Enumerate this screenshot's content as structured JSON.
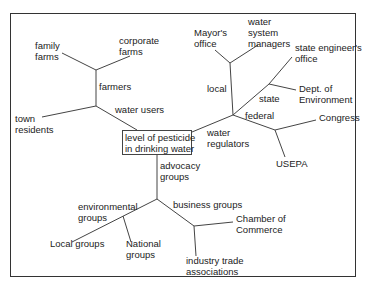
{
  "diagram": {
    "type": "tree",
    "root": "level of pesticide\nin drinking water",
    "labels": {
      "family_farms": "family\nfarms",
      "corporate_farms": "corporate\nfarms",
      "farmers": "farmers",
      "water_users": "water users",
      "town_residents": "town\nresidents",
      "mayors_office": "Mayor's\noffice",
      "water_system_managers": "water\nsystem\nmanagers",
      "local": "local",
      "state_engineers_office": "state engineer's\noffice",
      "state": "state",
      "dept_environment": "Dept. of\nEnvironment",
      "federal": "federal",
      "congress": "Congress",
      "water_regulators": "water\nregulators",
      "usepa": "USEPA",
      "advocacy_groups": "advocacy\ngroups",
      "environmental_groups": "environmental\ngroups",
      "business_groups": "business groups",
      "chamber_of_commerce": "Chamber of\nCommerce",
      "local_groups": "Local groups",
      "national_groups": "National\ngroups",
      "industry_trade": "industry trade\nassociations"
    },
    "structure": {
      "level of pesticide in drinking water": {
        "water users": {
          "farmers": [
            "family farms",
            "corporate farms"
          ],
          "town residents": []
        },
        "water regulators": {
          "local": [
            "Mayor's office",
            "water system managers"
          ],
          "state": [
            "state engineer's office",
            "Dept. of Environment"
          ],
          "federal": [
            "Congress",
            "USEPA"
          ]
        },
        "advocacy groups": {
          "environmental groups": [
            "Local groups",
            "National groups"
          ],
          "business groups": [
            "Chamber of Commerce",
            "industry trade associations"
          ]
        }
      }
    },
    "colors": {
      "line": "#444444",
      "text": "#222222",
      "border": "#333333"
    }
  }
}
